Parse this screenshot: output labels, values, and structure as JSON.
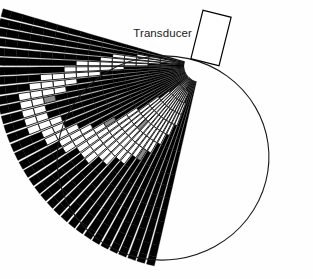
{
  "figure": {
    "type": "sector-scan-diagram",
    "title_label": "Transducer",
    "background_color": "#fefefe",
    "ink_color": "#000000",
    "mid_tone_color": "#808080",
    "outline_color": "#1a1a1a"
  },
  "transducer": {
    "label": "Transducer",
    "shape": "rectangle",
    "fill": "#ffffff",
    "stroke": "#000000",
    "stroke_width": 1.2,
    "center_x": 211,
    "center_y": 38,
    "width": 29,
    "height": 50,
    "rotation_deg": 14
  },
  "scan_fan": {
    "apex_x": 200,
    "apex_y": 66,
    "inner_radius": 16,
    "outer_radius": 205,
    "start_angle_deg": 104,
    "end_angle_deg": 196,
    "line_count": 34,
    "cell_rows": 16,
    "line_gap_deg": 0.55
  },
  "overlay_ellipse": {
    "center_x": 163,
    "center_y": 158,
    "radius_x": 106,
    "radius_y": 102,
    "rotation_deg": -8,
    "stroke": "#1a1a1a",
    "stroke_width": 1.1,
    "fill": "none"
  },
  "chart_data": {
    "type": "heatmap",
    "xlabel": "",
    "ylabel": "",
    "legend_position": "none",
    "grid": true,
    "angles_deg": [
      104,
      106.8,
      109.5,
      112.3,
      115,
      117.8,
      120.6,
      123.3,
      126.1,
      128.8,
      131.6,
      134.4,
      137.1,
      139.9,
      142.6,
      145.4,
      148.2,
      150.9,
      153.7,
      156.4,
      159.2,
      162,
      164.7,
      167.5,
      170.2,
      173,
      175.8,
      178.5,
      181.3,
      184,
      186.8,
      189.6,
      192.3,
      195.1
    ],
    "radii": [
      16,
      28,
      40,
      52,
      64,
      76,
      88,
      100,
      112,
      124,
      136,
      148,
      160,
      172,
      184,
      196,
      205
    ],
    "value_scale": {
      "0": "light",
      "1": "mid",
      "2": "dark"
    },
    "values": [
      [
        2,
        2,
        2,
        2,
        2,
        2,
        2,
        2,
        2,
        2,
        2,
        2,
        2,
        2,
        2,
        2
      ],
      [
        2,
        2,
        2,
        2,
        2,
        2,
        2,
        2,
        2,
        2,
        2,
        2,
        2,
        2,
        2,
        2
      ],
      [
        2,
        2,
        2,
        2,
        2,
        2,
        2,
        2,
        2,
        2,
        2,
        2,
        2,
        2,
        2,
        2
      ],
      [
        2,
        2,
        0,
        0,
        2,
        2,
        2,
        2,
        2,
        2,
        2,
        2,
        2,
        2,
        2,
        2
      ],
      [
        2,
        0,
        0,
        0,
        0,
        2,
        2,
        2,
        2,
        2,
        2,
        2,
        2,
        2,
        2,
        2
      ],
      [
        2,
        0,
        0,
        0,
        0,
        0,
        2,
        2,
        2,
        2,
        2,
        2,
        2,
        2,
        2,
        2
      ],
      [
        2,
        0,
        0,
        0,
        0,
        0,
        0,
        2,
        2,
        2,
        2,
        2,
        2,
        2,
        2,
        2
      ],
      [
        0,
        0,
        0,
        0,
        0,
        0,
        0,
        1,
        2,
        2,
        2,
        2,
        2,
        2,
        2,
        2
      ],
      [
        0,
        0,
        0,
        0,
        0,
        0,
        0,
        0,
        2,
        2,
        2,
        2,
        2,
        2,
        2,
        2
      ],
      [
        0,
        0,
        0,
        0,
        0,
        0,
        0,
        0,
        0,
        2,
        2,
        2,
        2,
        2,
        2,
        2
      ],
      [
        0,
        0,
        0,
        0,
        0,
        0,
        0,
        0,
        0,
        2,
        2,
        2,
        2,
        2,
        2,
        2
      ],
      [
        0,
        0,
        0,
        0,
        0,
        1,
        0,
        0,
        0,
        0,
        2,
        2,
        2,
        2,
        2,
        2
      ],
      [
        2,
        0,
        0,
        0,
        0,
        0,
        0,
        0,
        0,
        0,
        2,
        2,
        2,
        2,
        2,
        2
      ],
      [
        2,
        2,
        0,
        0,
        0,
        0,
        0,
        0,
        0,
        0,
        0,
        2,
        2,
        2,
        2,
        2
      ],
      [
        2,
        2,
        2,
        0,
        0,
        0,
        0,
        0,
        0,
        0,
        0,
        2,
        2,
        2,
        2,
        2
      ],
      [
        2,
        2,
        2,
        2,
        2,
        0,
        0,
        0,
        0,
        0,
        0,
        2,
        2,
        2,
        2,
        2
      ],
      [
        2,
        2,
        2,
        2,
        2,
        2,
        2,
        1,
        0,
        0,
        0,
        0,
        2,
        2,
        2,
        2
      ],
      [
        2,
        2,
        2,
        2,
        2,
        2,
        2,
        2,
        2,
        0,
        0,
        0,
        2,
        2,
        2,
        2
      ],
      [
        2,
        2,
        2,
        2,
        2,
        2,
        2,
        2,
        2,
        2,
        0,
        0,
        0,
        2,
        2,
        2
      ],
      [
        2,
        2,
        2,
        2,
        2,
        2,
        2,
        2,
        2,
        2,
        2,
        0,
        0,
        2,
        2,
        2
      ],
      [
        2,
        2,
        2,
        2,
        2,
        2,
        2,
        2,
        2,
        2,
        2,
        0,
        0,
        0,
        2,
        2
      ],
      [
        2,
        2,
        2,
        2,
        2,
        2,
        2,
        2,
        2,
        2,
        2,
        2,
        0,
        0,
        2,
        2
      ],
      [
        2,
        2,
        2,
        2,
        2,
        2,
        2,
        2,
        2,
        2,
        2,
        2,
        0,
        0,
        2,
        2
      ],
      [
        2,
        2,
        2,
        2,
        2,
        2,
        2,
        2,
        2,
        2,
        2,
        1,
        0,
        0,
        2,
        2
      ],
      [
        2,
        2,
        2,
        2,
        2,
        2,
        2,
        2,
        2,
        2,
        0,
        0,
        0,
        0,
        2,
        2
      ],
      [
        2,
        2,
        2,
        2,
        2,
        2,
        2,
        2,
        2,
        0,
        0,
        0,
        0,
        2,
        2,
        2
      ],
      [
        2,
        2,
        2,
        2,
        2,
        2,
        2,
        0,
        0,
        0,
        0,
        0,
        2,
        2,
        2,
        2
      ],
      [
        2,
        2,
        2,
        2,
        2,
        0,
        0,
        0,
        0,
        0,
        2,
        2,
        2,
        2,
        2,
        2
      ],
      [
        2,
        2,
        2,
        0,
        0,
        0,
        0,
        0,
        0,
        2,
        2,
        2,
        2,
        2,
        2,
        2
      ],
      [
        2,
        2,
        0,
        0,
        0,
        0,
        0,
        2,
        2,
        2,
        2,
        2,
        2,
        2,
        2,
        2
      ],
      [
        2,
        0,
        0,
        0,
        0,
        0,
        2,
        2,
        2,
        2,
        2,
        2,
        2,
        2,
        2,
        2
      ],
      [
        2,
        0,
        0,
        0,
        2,
        2,
        2,
        2,
        2,
        2,
        2,
        2,
        2,
        2,
        2,
        2
      ],
      [
        2,
        2,
        2,
        2,
        2,
        2,
        2,
        2,
        2,
        2,
        2,
        2,
        2,
        2,
        2,
        2
      ],
      [
        2,
        2,
        2,
        2,
        2,
        2,
        2,
        2,
        2,
        2,
        2,
        2,
        2,
        2,
        2,
        2
      ]
    ]
  }
}
